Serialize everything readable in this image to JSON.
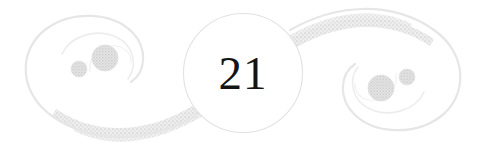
{
  "page": {
    "width": 485,
    "height": 155,
    "background_color": "#ffffff",
    "kind": "decorative-page-footer-ornament"
  },
  "ornament": {
    "page_number": "21",
    "medallion": {
      "name": "page-number-medallion",
      "center_x": 243,
      "center_y": 73,
      "radius": 60,
      "fill_color": "#ffffff",
      "stroke_color": "#e2e2e2",
      "stroke_width": 1.1
    },
    "flourish": {
      "name": "double-scroll-flourish",
      "description": "Mirrored pair of spiral scroll volutes joined by a textured double ribbon band passing behind the central medallion",
      "stroke_color": "#e6e6e6",
      "ribbon_color": "#e0e0e0",
      "ribbon_texture_color": "#d2d2d2"
    },
    "left_scroll": {
      "name": "left-scroll-volute",
      "large_dot": {
        "cx": 105,
        "cy": 58,
        "r": 13,
        "color": "#d9d9d9"
      },
      "small_dot": {
        "cx": 79,
        "cy": 69,
        "r": 8,
        "color": "#dddddd"
      }
    },
    "right_scroll": {
      "name": "right-scroll-volute",
      "large_dot": {
        "cx": 381,
        "cy": 101,
        "r": 13,
        "color": "#d9d9d9"
      },
      "small_dot": {
        "cx": 407,
        "cy": 90,
        "r": 8,
        "color": "#dddddd"
      }
    },
    "colors": {
      "number": "#141414",
      "outline": "#e6e6e6",
      "dot": "#d9d9d9",
      "ribbon": "#e0e0e0",
      "background": "#ffffff"
    }
  }
}
